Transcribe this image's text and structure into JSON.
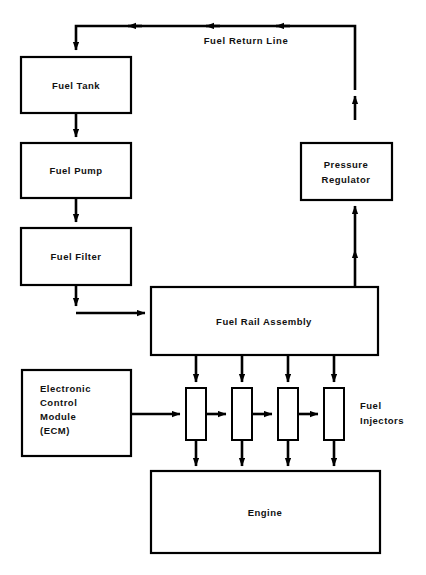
{
  "diagram": {
    "canvas": {
      "width": 426,
      "height": 575,
      "background": "#ffffff",
      "line_color": "#000000"
    },
    "blocks": {
      "fuel_tank": {
        "label": "Fuel Tank",
        "x": 21,
        "y": 57,
        "w": 110,
        "h": 56
      },
      "fuel_pump": {
        "label": "Fuel Pump",
        "x": 21,
        "y": 143,
        "w": 110,
        "h": 55
      },
      "fuel_filter": {
        "label": "Fuel Filter",
        "x": 21,
        "y": 228,
        "w": 110,
        "h": 57
      },
      "pressure_regulator": {
        "label_line1": "Pressure",
        "label_line2": "Regulator",
        "x": 301,
        "y": 143,
        "w": 91,
        "h": 57
      },
      "fuel_rail_assembly": {
        "label": "Fuel Rail Assembly",
        "x": 151,
        "y": 287,
        "w": 227,
        "h": 68
      },
      "ecm": {
        "label_line1": "Electronic",
        "label_line2": "Control",
        "label_line3": "Module",
        "label_line4": "(ECM)",
        "x": 22,
        "y": 370,
        "w": 109,
        "h": 86
      },
      "engine": {
        "label": "Engine",
        "x": 151,
        "y": 471,
        "w": 229,
        "h": 82
      },
      "injectors": [
        {
          "label": "injector-1",
          "x": 186,
          "y": 388,
          "w": 20,
          "h": 52
        },
        {
          "label": "injector-2",
          "x": 232,
          "y": 388,
          "w": 20,
          "h": 52
        },
        {
          "label": "injector-3",
          "x": 278,
          "y": 388,
          "w": 20,
          "h": 52
        },
        {
          "label": "injector-4",
          "x": 324,
          "y": 388,
          "w": 20,
          "h": 52
        }
      ]
    },
    "annotations": {
      "fuel_return_line": "Fuel Return Line",
      "fuel_injectors_line1": "Fuel",
      "fuel_injectors_line2": "Injectors"
    },
    "flow": {
      "return_line_description": "Pressure Regulator to Fuel Tank via top return line",
      "supply_chain": [
        "Fuel Tank",
        "Fuel Pump",
        "Fuel Filter",
        "Fuel Rail Assembly"
      ],
      "rail_to_injectors": 4,
      "injectors_to_engine": 4,
      "ecm_to_injectors": true,
      "rail_to_regulator": true
    }
  }
}
